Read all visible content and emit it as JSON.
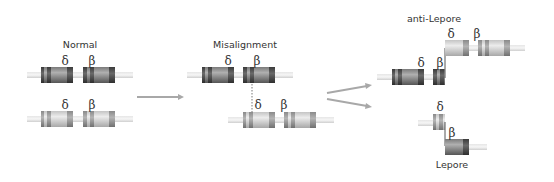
{
  "labels": {
    "normal": "Normal",
    "misalignment": "Misalignment",
    "anti_lepore": "anti-Lepore",
    "lepore": "Lepore",
    "delta": "δ",
    "beta": "β"
  },
  "colors": {
    "background": "#ffffff",
    "chromosome_line": "#dcdcdc",
    "dark_gene_body": "#8e8e8e",
    "dark_gene_band": "#4a4a4a",
    "light_gene_body": "#d6d6d6",
    "light_gene_band": "#8a8a8a",
    "arrow": "#a0a0a0",
    "text": "#333333"
  },
  "panels": [
    {
      "name": "normal",
      "title": "Normal",
      "chromosomes": [
        {
          "shade": "dark",
          "genes": [
            "δ",
            "β"
          ]
        },
        {
          "shade": "light",
          "genes": [
            "δ",
            "β"
          ]
        }
      ]
    },
    {
      "name": "misalignment",
      "title": "Misalignment",
      "chromosomes": [
        {
          "shade": "dark",
          "genes": [
            "δ",
            "β"
          ]
        },
        {
          "shade": "light",
          "genes": [
            "δ",
            "β"
          ],
          "offset": "shifted right; δ aligned under β"
        }
      ]
    },
    {
      "name": "products",
      "chromosomes": [
        {
          "title": "anti-Lepore",
          "genes": [
            "δ",
            "δβ",
            "β"
          ]
        },
        {
          "title": "Lepore",
          "genes": [
            "δβ fusion"
          ]
        }
      ]
    }
  ]
}
